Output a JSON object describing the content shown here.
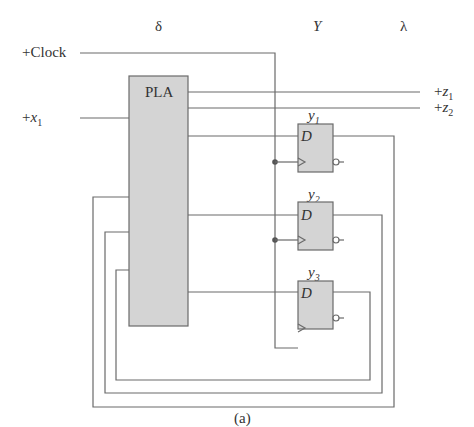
{
  "headers": {
    "delta": "δ",
    "Y": "Y",
    "lambda": "λ"
  },
  "inputs": {
    "clock": "+Clock",
    "x1_prefix": "+",
    "x1_var": "x",
    "x1_sub": "1"
  },
  "outputs": [
    {
      "prefix": "+",
      "var": "z",
      "sub": "1"
    },
    {
      "prefix": "+",
      "var": "z",
      "sub": "2"
    }
  ],
  "pla": {
    "label": "PLA"
  },
  "flipflops": [
    {
      "name_var": "y",
      "name_sub": "1",
      "d_label": "D"
    },
    {
      "name_var": "y",
      "name_sub": "2",
      "d_label": "D"
    },
    {
      "name_var": "y",
      "name_sub": "3",
      "d_label": "D"
    }
  ],
  "caption": "(a)",
  "colors": {
    "box_fill": "#d4d4d4",
    "wire": "#6a6a6a",
    "text": "#333333"
  }
}
